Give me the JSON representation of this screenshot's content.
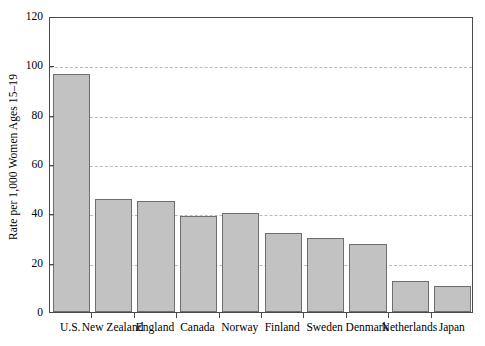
{
  "chart_data": {
    "type": "bar",
    "title": "",
    "subtitle": "",
    "xlabel": "",
    "ylabel": "Rate per 1,000 Women Ages 15–19",
    "categories": [
      "U.S.",
      "New Zealand",
      "England",
      "Canada",
      "Norway",
      "Finland",
      "Sweden",
      "Denmark",
      "Netherlands",
      "Japan"
    ],
    "values": [
      96.5,
      46,
      45,
      39,
      40,
      32,
      30,
      27.5,
      12.5,
      10.5
    ],
    "ylim": [
      0,
      120
    ],
    "yticks": [
      0,
      20,
      40,
      60,
      80,
      100,
      120
    ],
    "ytick_labels": [
      "0",
      "20",
      "40",
      "60",
      "80",
      "100",
      "120"
    ],
    "grid": true,
    "grid_axis": "y",
    "grid_style": "dashed",
    "legend": false,
    "legend_position": "none",
    "bar_fill_color": "#c2c2c2",
    "bar_edge_color": "#6e6e6e",
    "grid_color": "#b9b9b9",
    "axis_color": "#4a4a4a",
    "text_color": "#000000",
    "background_color": "#ffffff"
  },
  "axes": {
    "y_title": "Rate per 1,000 Women Ages 15–19"
  }
}
